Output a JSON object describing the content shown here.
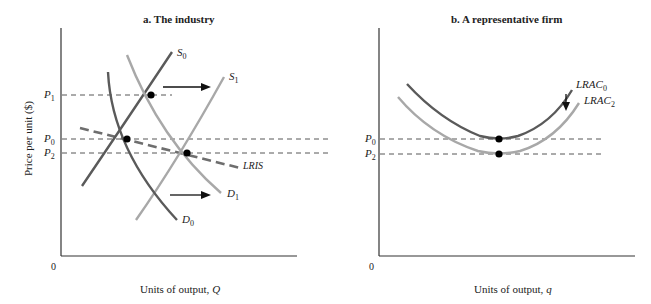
{
  "panels": [
    {
      "title": "a. The industry",
      "xlabel": "Units of output,",
      "xvar": "Q",
      "ylabel": "Price per unit ($)",
      "origin": "0",
      "price_labels": [
        {
          "name": "P",
          "sub": "1"
        },
        {
          "name": "P",
          "sub": "0"
        },
        {
          "name": "P",
          "sub": "2"
        }
      ],
      "curves": [
        {
          "name": "S",
          "sub": "0"
        },
        {
          "name": "S",
          "sub": "1"
        },
        {
          "name": "D",
          "sub": "0"
        },
        {
          "name": "D",
          "sub": "1"
        },
        {
          "name": "LRIS",
          "sub": ""
        }
      ]
    },
    {
      "title": "b. A representative firm",
      "xlabel": "Units of output,",
      "xvar": "q",
      "origin": "0",
      "price_labels": [
        {
          "name": "P",
          "sub": "0"
        },
        {
          "name": "P",
          "sub": "2"
        }
      ],
      "curves": [
        {
          "name": "LRAC",
          "sub": "0"
        },
        {
          "name": "LRAC",
          "sub": "2"
        }
      ]
    }
  ],
  "colors": {
    "axis": "#333333",
    "dark_curve": "#5a5a5a",
    "light_curve": "#a8a8a8",
    "lris": "#6e6e6e",
    "dashed": "#444444",
    "point": "#000000"
  }
}
